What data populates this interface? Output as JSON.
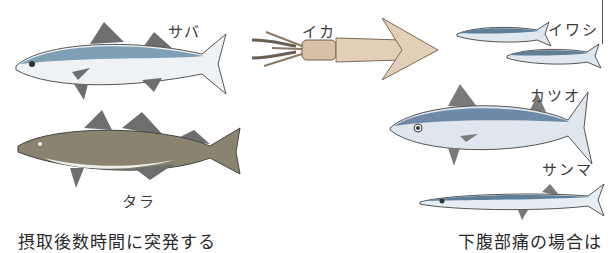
{
  "figure": {
    "fish": [
      {
        "id": "saba",
        "label": "サバ"
      },
      {
        "id": "ika",
        "label": "イカ"
      },
      {
        "id": "iwashi",
        "label": "イワシ"
      },
      {
        "id": "tara",
        "label": "タラ"
      },
      {
        "id": "katsuo",
        "label": "カツオ"
      },
      {
        "id": "sanma",
        "label": "サンマ"
      }
    ],
    "captions": {
      "left": "摂取後数時間に突発する",
      "right": "下腹部痛の場合は"
    },
    "colors": {
      "mackerel_back": "#7f9fb5",
      "belly": "#eef2f4",
      "fin": "#6f6f6f",
      "squid": "#e3cfb5",
      "cod": "#8a8370"
    }
  }
}
